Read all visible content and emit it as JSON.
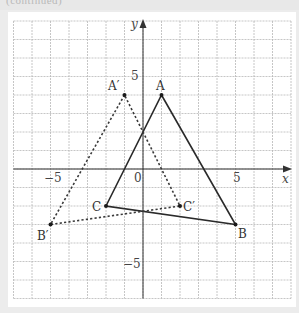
{
  "header": {
    "cropped_text": "(continued)"
  },
  "chart_data": {
    "type": "scatter",
    "title": "",
    "xlabel": "x",
    "ylabel": "y",
    "xlim": [
      -7,
      8
    ],
    "ylim": [
      -7,
      8
    ],
    "grid": true,
    "tick_labels": {
      "x": [
        "-5",
        "0",
        "5"
      ],
      "y": [
        "5",
        "-5"
      ]
    },
    "origin_label": "0",
    "series": [
      {
        "name": "Triangle ABC",
        "style": "solid",
        "points": [
          {
            "label": "A",
            "x": 1,
            "y": 4
          },
          {
            "label": "B",
            "x": 5,
            "y": -3
          },
          {
            "label": "C",
            "x": -2,
            "y": -2
          }
        ]
      },
      {
        "name": "Triangle A'B'C' (reflection in y-axis)",
        "style": "dotted",
        "points": [
          {
            "label": "A′",
            "x": -1,
            "y": 4
          },
          {
            "label": "B′",
            "x": -5,
            "y": -3
          },
          {
            "label": "C′",
            "x": 2,
            "y": -2
          }
        ]
      }
    ]
  },
  "labels": {
    "x_axis": "x",
    "y_axis": "y",
    "origin": "0",
    "x_tick_neg5": "−5",
    "x_tick_5": "5",
    "y_tick_5": "5",
    "y_tick_neg5": "−5",
    "A": "A",
    "B": "B",
    "C": "C",
    "A_prime": "A′",
    "B_prime": "B′",
    "C_prime": "C′"
  }
}
